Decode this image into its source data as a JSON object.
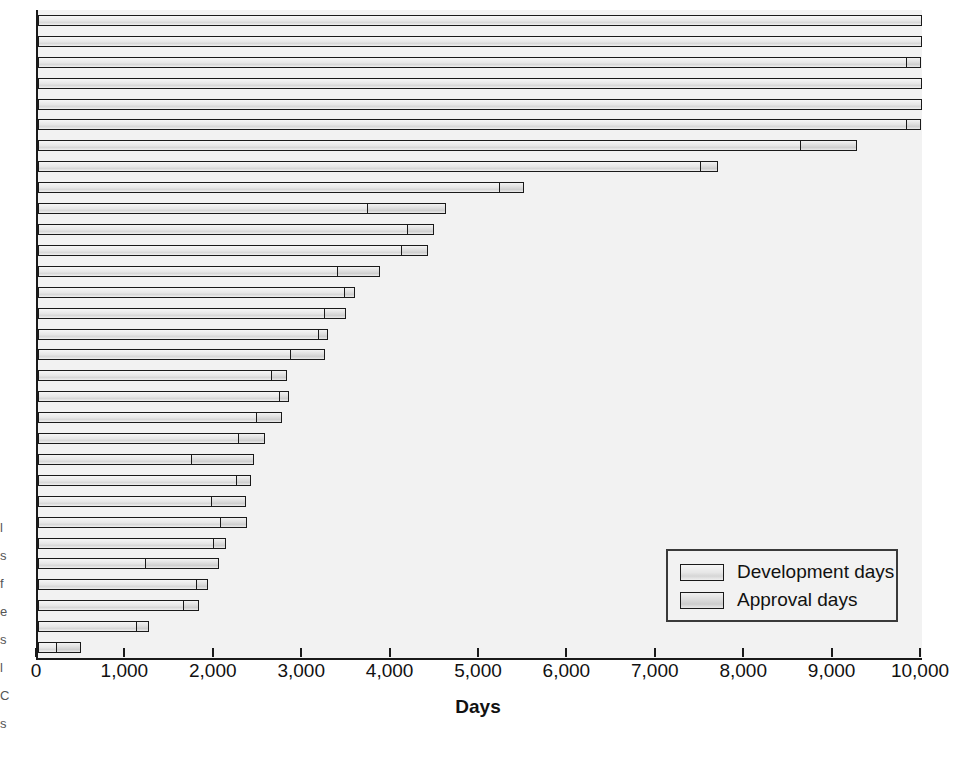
{
  "chart_data": {
    "type": "bar",
    "orientation": "horizontal",
    "stacked": true,
    "title": "",
    "xlabel": "Days",
    "ylabel": "",
    "xlim": [
      0,
      10000
    ],
    "xticks": [
      0,
      1000,
      2000,
      3000,
      4000,
      5000,
      6000,
      7000,
      8000,
      9000,
      10000
    ],
    "xticklabels": [
      "0",
      "1,000",
      "2,000",
      "3,000",
      "4,000",
      "5,000",
      "6,000",
      "7,000",
      "8,000",
      "9,000",
      "10,000"
    ],
    "grid": false,
    "legend_position": "lower right",
    "series": [
      {
        "name": "Development days",
        "key": "development",
        "values": [
          10000,
          10000,
          9830,
          10000,
          10000,
          9830,
          8630,
          7510,
          5230,
          3740,
          4190,
          4120,
          3400,
          3480,
          3250,
          3180,
          2870,
          2650,
          2740,
          2480,
          2280,
          1750,
          2250,
          1970,
          2080,
          1990,
          1230,
          1800,
          1660,
          1120,
          215
        ]
      },
      {
        "name": "Approval days",
        "key": "approval",
        "values": [
          0,
          0,
          170,
          0,
          0,
          170,
          650,
          200,
          280,
          890,
          310,
          310,
          490,
          120,
          250,
          120,
          390,
          180,
          120,
          300,
          300,
          710,
          180,
          400,
          300,
          150,
          830,
          140,
          180,
          150,
          285
        ]
      }
    ],
    "totals": [
      10000,
      10000,
      10000,
      10000,
      10000,
      10000,
      9280,
      7710,
      5510,
      4630,
      4500,
      4430,
      3890,
      3600,
      3500,
      3300,
      3260,
      2830,
      2860,
      2780,
      2580,
      2460,
      2430,
      2370,
      2380,
      2140,
      2060,
      1940,
      1840,
      1270,
      500
    ],
    "bar_count": 31
  },
  "legend": {
    "items": [
      {
        "label": "Development days",
        "swatch": "dev"
      },
      {
        "label": "Approval days",
        "swatch": "app"
      }
    ]
  },
  "axis": {
    "x_title": "Days"
  },
  "margin_fragments": [
    "l",
    "s",
    "f",
    "e",
    "s",
    "l",
    "C",
    "s"
  ]
}
